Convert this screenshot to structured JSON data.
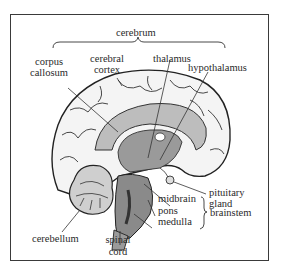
{
  "diagram": {
    "colors": {
      "ink": "#2a2a2a",
      "frame": "#3a3a3a",
      "shade": "#8a8a8a",
      "dark": "#555555"
    },
    "labels": {
      "cerebrum": "cerebrum",
      "corpus_callosum_1": "corpus",
      "corpus_callosum_2": "callosum",
      "cerebral_cortex_1": "cerebral",
      "cerebral_cortex_2": "cortex",
      "thalamus": "thalamus",
      "hypothalamus": "hypothalamus",
      "pituitary_gland_1": "pituitary",
      "pituitary_gland_2": "gland",
      "midbrain": "midbrain",
      "pons": "pons",
      "medulla": "medulla",
      "brainstem": "brainstem",
      "cerebellum": "cerebellum",
      "spinal_cord_1": "spinal",
      "spinal_cord_2": "cord"
    },
    "groups": [
      {
        "name": "cerebrum",
        "members": [
          "corpus callosum",
          "cerebral cortex",
          "thalamus",
          "hypothalamus"
        ]
      },
      {
        "name": "brainstem",
        "members": [
          "midbrain",
          "pons",
          "medulla"
        ]
      }
    ]
  }
}
